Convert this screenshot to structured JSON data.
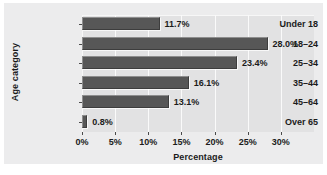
{
  "chart_data": {
    "type": "bar",
    "orientation": "horizontal",
    "title": "",
    "xlabel": "Percentage",
    "ylabel": "Age category",
    "categories": [
      "Under 18",
      "18–24",
      "25–34",
      "35–44",
      "45–64",
      "Over 65"
    ],
    "values": [
      11.7,
      28.0,
      23.4,
      16.1,
      13.1,
      0.8
    ],
    "value_labels": [
      "11.7%",
      "28.0%",
      "23.4%",
      "16.1%",
      "13.1%",
      "0.8%"
    ],
    "xlim": [
      0,
      35
    ],
    "xticks": [
      0,
      5,
      10,
      15,
      20,
      25,
      30
    ],
    "xtick_labels": [
      "0%",
      "5%",
      "10%",
      "15%",
      "20%",
      "25%",
      "30%"
    ],
    "grid": "vertical",
    "legend": "none",
    "colors": {
      "bar_fill": "#575757",
      "bar_highlight": "#8e8e8e",
      "plot_background": "#e2e2e3",
      "figure_background": "#ececed",
      "gridline": "#fafafa",
      "text": "#1b1b1b"
    }
  }
}
